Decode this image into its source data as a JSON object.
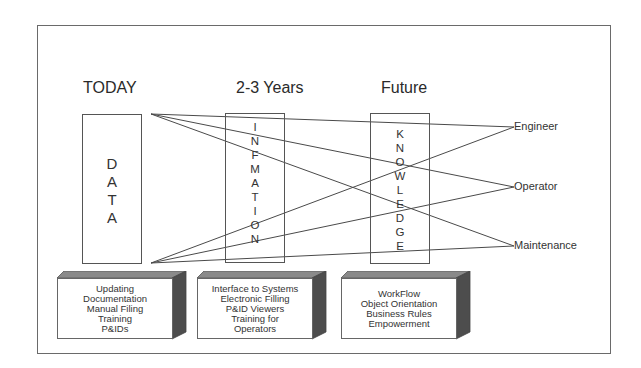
{
  "headings": {
    "today": "TODAY",
    "mid": "2-3 Years",
    "future": "Future"
  },
  "columns": {
    "data": [
      "D",
      "A",
      "T",
      "A"
    ],
    "information": [
      "I",
      "N",
      "F",
      "M",
      "A",
      "T",
      "I",
      "O",
      "N"
    ],
    "knowledge": [
      "K",
      "N",
      "O",
      "W",
      "L",
      "E",
      "D",
      "G",
      "E"
    ]
  },
  "roles": {
    "engineer": "Engineer",
    "operator": "Operator",
    "maintenance": "Maintenance"
  },
  "boxes": {
    "today": [
      "Updating",
      "Documentation",
      "Manual Filing",
      "Training",
      "P&IDs"
    ],
    "mid": [
      "Interface to Systems",
      "Electronic Filling",
      "P&ID Viewers",
      "Training for",
      "Operators"
    ],
    "future": [
      "WorkFlow",
      "Object Orientation",
      "Business Rules",
      "Empowerment"
    ]
  },
  "colors": {
    "line": "#4a4a4a",
    "box_side": "#4d4d4d",
    "box_top": "#8a8a8a"
  }
}
